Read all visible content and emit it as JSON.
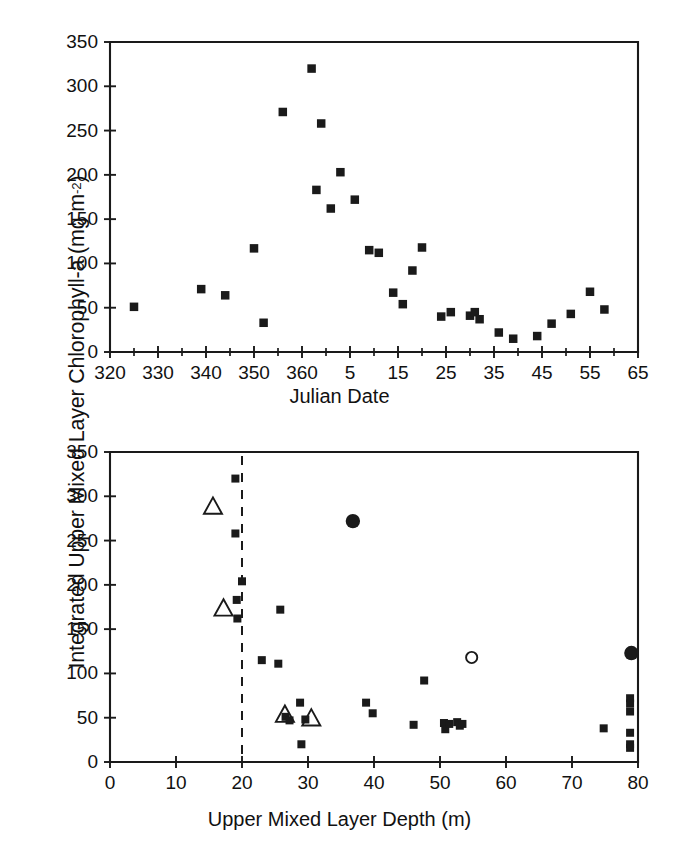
{
  "figure": {
    "y_axis_label_main": "Integrated Upper Mixed Layer Chlorophyll-a (mg m",
    "y_axis_label_sup": "-2",
    "y_axis_label_tail": ")"
  },
  "chart_data": [
    {
      "id": "top",
      "type": "scatter",
      "title": "",
      "xlabel": "Julian Date",
      "ylabel": "Integrated Upper Mixed Layer Chlorophyll-a (mg m-2)",
      "xlim": [
        320,
        430
      ],
      "ylim": [
        0,
        350
      ],
      "grid": false,
      "legend": "none",
      "xticks": [
        320,
        330,
        340,
        350,
        360,
        370,
        380,
        390,
        400,
        410,
        420,
        430
      ],
      "xticklabels": [
        "320",
        "330",
        "340",
        "350",
        "360",
        "5",
        "15",
        "25",
        "35",
        "45",
        "55",
        "65"
      ],
      "xminorticks": [
        325,
        335,
        345,
        355,
        365,
        375,
        385,
        395,
        405,
        415,
        425
      ],
      "yticks": [
        0,
        50,
        100,
        150,
        200,
        250,
        300,
        350
      ],
      "yticklabels": [
        "0",
        "50",
        "100",
        "150",
        "200",
        "250",
        "300",
        "350"
      ],
      "series": [
        {
          "name": "Integrated chlorophyll-a",
          "marker": "filled-square",
          "points": [
            [
              325,
              51
            ],
            [
              339,
              71
            ],
            [
              344,
              64
            ],
            [
              350,
              117
            ],
            [
              352,
              33
            ],
            [
              356,
              271
            ],
            [
              362,
              320
            ],
            [
              363,
              183
            ],
            [
              364,
              258
            ],
            [
              366,
              162
            ],
            [
              368,
              203
            ],
            [
              371,
              172
            ],
            [
              374,
              115
            ],
            [
              376,
              112
            ],
            [
              379,
              67
            ],
            [
              381,
              54
            ],
            [
              383,
              92
            ],
            [
              385,
              118
            ],
            [
              389,
              40
            ],
            [
              391,
              45
            ],
            [
              395,
              41
            ],
            [
              396,
              45
            ],
            [
              397,
              37
            ],
            [
              401,
              22
            ],
            [
              404,
              15
            ],
            [
              409,
              18
            ],
            [
              412,
              32
            ],
            [
              416,
              43
            ],
            [
              420,
              68
            ],
            [
              423,
              48
            ]
          ]
        }
      ]
    },
    {
      "id": "bottom",
      "type": "scatter",
      "title": "",
      "xlabel": "Upper Mixed Layer Depth (m)",
      "ylabel": "Integrated Upper Mixed Layer Chlorophyll-a (mg m-2)",
      "xlim": [
        0,
        80
      ],
      "ylim": [
        0,
        350
      ],
      "grid": false,
      "legend": "none",
      "xticks": [
        0,
        10,
        20,
        30,
        40,
        50,
        60,
        70,
        80
      ],
      "xticklabels": [
        "0",
        "10",
        "20",
        "30",
        "40",
        "50",
        "60",
        "70",
        "80"
      ],
      "yticks": [
        0,
        50,
        100,
        150,
        200,
        250,
        300,
        350
      ],
      "yticklabels": [
        "0",
        "50",
        "100",
        "150",
        "200",
        "250",
        "300",
        "350"
      ],
      "reference_line": {
        "orientation": "vertical",
        "x": 20,
        "style": "dashed"
      },
      "series": [
        {
          "name": "Stations (filled squares)",
          "marker": "filled-square",
          "points": [
            [
              19.0,
              320
            ],
            [
              19.0,
              258
            ],
            [
              20.0,
              204
            ],
            [
              19.2,
              183
            ],
            [
              19.3,
              162
            ],
            [
              23.0,
              115
            ],
            [
              25.5,
              111
            ],
            [
              25.8,
              172
            ],
            [
              28.8,
              67
            ],
            [
              26.6,
              51
            ],
            [
              27.2,
              47
            ],
            [
              29.0,
              20
            ],
            [
              29.6,
              48
            ],
            [
              38.8,
              67
            ],
            [
              39.8,
              55
            ],
            [
              46.0,
              42
            ],
            [
              47.6,
              92
            ],
            [
              50.6,
              44
            ],
            [
              50.8,
              37
            ],
            [
              51.4,
              43
            ],
            [
              52.6,
              45
            ],
            [
              53.0,
              41
            ],
            [
              53.4,
              43
            ],
            [
              74.8,
              38
            ],
            [
              78.8,
              72
            ],
            [
              78.8,
              66
            ],
            [
              78.8,
              57
            ],
            [
              78.8,
              33
            ],
            [
              78.8,
              20
            ],
            [
              78.8,
              16
            ]
          ]
        },
        {
          "name": "Open triangles",
          "marker": "open-triangle",
          "points": [
            [
              15.6,
              288
            ],
            [
              17.2,
              173
            ],
            [
              26.5,
              53
            ],
            [
              30.5,
              49
            ]
          ]
        },
        {
          "name": "Filled circles",
          "marker": "filled-circle",
          "points": [
            [
              36.8,
              272
            ],
            [
              79.0,
              123
            ]
          ]
        },
        {
          "name": "Open circle",
          "marker": "open-circle",
          "points": [
            [
              54.8,
              118
            ]
          ]
        }
      ]
    }
  ]
}
